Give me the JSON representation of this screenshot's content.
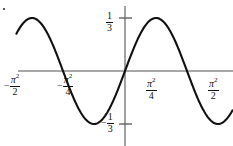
{
  "figure": {
    "kind": "math-graph",
    "background": "#ffffff",
    "curve_color": "#111111",
    "axis_color": "#8a8a8a",
    "tick_color": "#555555",
    "corner_mark": "•"
  },
  "axes": {
    "x_axis": {
      "y_pixel": 71,
      "x_start": 18,
      "x_end": 233
    },
    "y_axis": {
      "x_pixel": 125,
      "y_start": 6,
      "y_end": 146
    },
    "x_ticks": [
      {
        "id": "neg-pi2-over-2",
        "sign": "−",
        "numerator": "π",
        "exponent": "2",
        "denominator": "2",
        "value": -4.9348
      },
      {
        "id": "neg-pi2-over-4",
        "sign": "−",
        "numerator": "π",
        "exponent": "2",
        "denominator": "4",
        "value": -2.4674
      },
      {
        "id": "pi2-over-4",
        "sign": "",
        "numerator": "π",
        "exponent": "2",
        "denominator": "4",
        "value": 2.4674
      },
      {
        "id": "pi2-over-2",
        "sign": "",
        "numerator": "π",
        "exponent": "2",
        "denominator": "2",
        "value": 4.9348
      }
    ],
    "y_ticks": [
      {
        "id": "one-third",
        "sign": "",
        "numerator": "1",
        "denominator": "3",
        "value": 0.3333,
        "y_pixel": 18
      },
      {
        "id": "neg-one-third",
        "sign": "−",
        "numerator": "1",
        "denominator": "3",
        "value": -0.3333,
        "y_pixel": 124
      }
    ]
  },
  "chart_data": {
    "type": "line",
    "title": "",
    "xlabel": "",
    "ylabel": "",
    "xlim": [
      -6.0,
      6.2
    ],
    "ylim": [
      -0.52,
      0.52
    ],
    "grid": false,
    "legend": null,
    "x_tick_labels": [
      "−π²/2",
      "−π²/4",
      "π²/4",
      "π²/2"
    ],
    "x_tick_values": [
      -4.9348,
      -2.4674,
      2.4674,
      4.9348
    ],
    "y_tick_labels": [
      "1/3",
      "−1/3"
    ],
    "y_tick_values": [
      0.3333,
      -0.3333
    ],
    "series": [
      {
        "name": "y = (1/3) sin(2πx/π²)",
        "amplitude": 0.3333,
        "period": 4.9348,
        "zero_crossings": [
          -4.9348,
          -2.4674,
          0,
          2.4674,
          4.9348
        ],
        "maxima_x": [
          -3.7011,
          1.2337
        ],
        "minima_x": [
          -1.2337,
          3.7011
        ],
        "x": [
          -6.0,
          -5.6,
          -5.2,
          -4.9348,
          -4.6,
          -4.3,
          -4.0,
          -3.7011,
          -3.4,
          -3.1,
          -2.8,
          -2.4674,
          -2.1,
          -1.8,
          -1.5,
          -1.2337,
          -0.95,
          -0.65,
          -0.35,
          0.0,
          0.35,
          0.65,
          0.95,
          1.2337,
          1.5,
          1.8,
          2.1,
          2.4674,
          2.8,
          3.1,
          3.4,
          3.7011,
          4.0,
          4.3,
          4.6,
          4.9348,
          5.2,
          5.6,
          6.0
        ],
        "y": [
          -0.256,
          -0.3223,
          -0.3324,
          -0.3333,
          -0.3138,
          -0.2711,
          -0.2074,
          -0.1111,
          -0.0066,
          0.1049,
          0.2044,
          0.3055,
          0.332,
          0.3215,
          0.2766,
          0.2037,
          0.1082,
          -0.0097,
          -0.1307,
          -0.256,
          -0.3223,
          -0.3324,
          -0.3333,
          -0.3138,
          -0.2711,
          -0.2074,
          -0.1111,
          -0.0066,
          0.1049,
          0.2044,
          0.3055,
          0.332,
          0.3215,
          0.2766,
          0.2037,
          0.1082,
          -0.0097,
          -0.1307,
          -0.256
        ]
      }
    ]
  }
}
